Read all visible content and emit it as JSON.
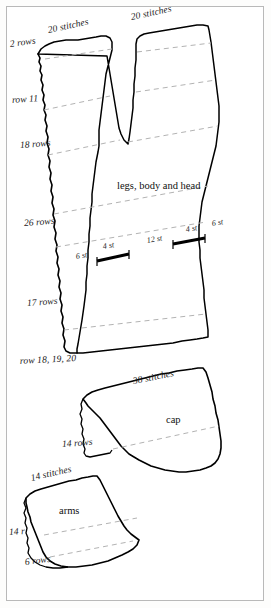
{
  "diagram": {
    "background_color": "#ffffff",
    "outline_color": "#000000",
    "guide_color": "#b0b0b0",
    "frame_color": "#b9b9b9"
  },
  "pieces": [
    {
      "id": "legs-body-head",
      "name": "legs, body and head",
      "top_labels": [
        "20 stitches",
        "20 stitches"
      ],
      "left_labels": [
        "2 rows",
        "row 11",
        "18 rows",
        "26 rows",
        "17 rows",
        "row 18, 19, 20"
      ]
    },
    {
      "id": "cap",
      "name": "cap",
      "top_labels": [
        "38 stitches"
      ],
      "left_labels": [
        "14 rows"
      ]
    },
    {
      "id": "arms",
      "name": "arms",
      "top_labels": [
        "14 stitches"
      ],
      "left_labels": [
        "14 r",
        "6 rows"
      ]
    }
  ],
  "labels": {
    "stitches_top_left": "20 stitches",
    "stitches_top_right": "20 stitches",
    "rows_2": "2 rows",
    "row_11": "row 11",
    "rows_18": "18 rows",
    "piece_body": "legs, body and head",
    "rows_26": "26 rows",
    "rows_17": "17 rows",
    "row_18_19_20": "row 18, 19, 20",
    "stitches_38": "38 stitches",
    "piece_cap": "cap",
    "rows_14": "14 rows",
    "stitches_14": "14 stitches",
    "piece_arms": "arms",
    "rows_14r": "14 r",
    "rows_6": "6 rows"
  },
  "stitch_marks": {
    "left_6st": "6 st",
    "left_4st": "4 st",
    "center_12st": "12 st",
    "right_4st": "4 st",
    "right_6st": "6 st"
  }
}
